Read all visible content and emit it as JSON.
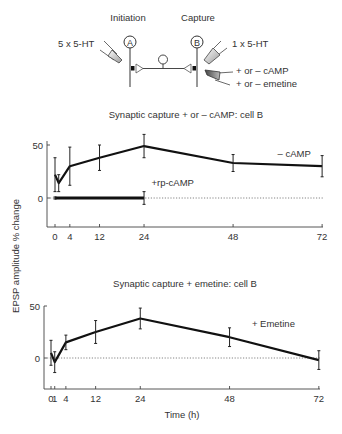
{
  "diagram": {
    "initiation_label": "Initiation",
    "capture_label": "Capture",
    "cell_a_label": "A",
    "cell_b_label": "B",
    "stim_a_label": "5 x 5-HT",
    "stim_b_label": "1 x 5-HT",
    "drug_label_1": "+ or – cAMP",
    "drug_label_2": "+ or – emetine",
    "pipette_light_color": "#bbbbbb",
    "pipette_dark_color": "#666666"
  },
  "shared": {
    "ylabel": "EPSP amplitude % change",
    "xlabel": "Time (h)"
  },
  "chart_data": [
    {
      "type": "line",
      "title": "Synaptic capture + or – cAMP: cell B",
      "xlabel": "",
      "ylabel": "EPSP amplitude % change",
      "x_ticks": [
        0,
        4,
        12,
        24,
        48,
        72
      ],
      "y_ticks": [
        0,
        50
      ],
      "xlim": [
        0,
        72
      ],
      "ylim": [
        -30,
        55
      ],
      "grid": false,
      "baseline": {
        "y": 0,
        "style": "dotted"
      },
      "series": [
        {
          "name": "– cAMP",
          "x": [
            0,
            1,
            4,
            12,
            24,
            48,
            72
          ],
          "values": [
            22,
            14,
            30,
            38,
            49,
            33,
            30
          ],
          "errors": [
            16,
            8,
            18,
            12,
            11,
            8,
            10
          ]
        },
        {
          "name": "+rp-cAMP",
          "x": [
            0,
            24
          ],
          "values": [
            0,
            0
          ],
          "errors": [
            1,
            6
          ]
        }
      ],
      "annotations": [
        {
          "text": "– cAMP",
          "x": 60,
          "y": 39
        },
        {
          "text": "+rp-cAMP",
          "x": 26,
          "y": 11
        }
      ]
    },
    {
      "type": "line",
      "title": "Synaptic capture + emetine: cell B",
      "xlabel": "Time (h)",
      "ylabel": "EPSP amplitude % change",
      "x_ticks": [
        0,
        1,
        4,
        12,
        24,
        48,
        72
      ],
      "y_ticks": [
        0,
        50
      ],
      "xlim": [
        0,
        72
      ],
      "ylim": [
        -30,
        55
      ],
      "grid": false,
      "baseline": {
        "y": 0,
        "style": "dotted"
      },
      "series": [
        {
          "name": "+ Emetine",
          "x": [
            0,
            1,
            4,
            12,
            24,
            48,
            72
          ],
          "values": [
            5,
            -4,
            15,
            25,
            38,
            20,
            -2
          ],
          "errors": [
            12,
            10,
            7,
            11,
            10,
            9,
            9
          ]
        }
      ],
      "annotations": [
        {
          "text": "+ Emetine",
          "x": 54,
          "y": 30
        }
      ]
    }
  ]
}
